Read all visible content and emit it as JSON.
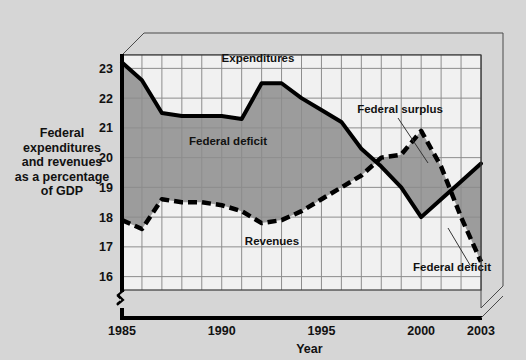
{
  "figure": {
    "background_color": "#d6d6d6",
    "plot_background_color": "#f1f1f1",
    "fill_color": "#9c9c9c",
    "line_color": "#000000",
    "grid_color": "#8d8d8d",
    "frame_color": "#000000"
  },
  "side_label": {
    "lines": [
      "Federal",
      "expenditures",
      "and revenues",
      "as a percentage",
      "of GDP"
    ]
  },
  "axes": {
    "x_title": "Year",
    "y_ticks": [
      "16",
      "17",
      "18",
      "19",
      "20",
      "21",
      "22",
      "23"
    ],
    "x_ticks": [
      "1985",
      "1990",
      "1995",
      "2000",
      "2003"
    ],
    "axis_break_symbol": "break-mark"
  },
  "annotations": [
    {
      "id": "expenditures",
      "text": "Expenditures"
    },
    {
      "id": "federal-deficit-left",
      "text": "Federal deficit"
    },
    {
      "id": "revenues",
      "text": "Revenues"
    },
    {
      "id": "federal-surplus",
      "text": "Federal surplus"
    },
    {
      "id": "federal-deficit-right",
      "text": "Federal deficit"
    }
  ],
  "chart_data": {
    "type": "line",
    "title": "",
    "subtitle": "",
    "xlabel": "Year",
    "ylabel": "Federal expenditures and revenues as a percentage of GDP",
    "xlim": [
      1985,
      2003
    ],
    "ylim": [
      15.5,
      23.6
    ],
    "ytick_values": [
      16,
      17,
      18,
      19,
      20,
      21,
      22,
      23
    ],
    "xtick_values": [
      1985,
      1990,
      1995,
      2000,
      2003
    ],
    "y_axis_broken_below": 16,
    "grid": true,
    "legend": "inline-annotations",
    "x": [
      1985,
      1986,
      1987,
      1988,
      1989,
      1990,
      1991,
      1992,
      1993,
      1994,
      1995,
      1996,
      1997,
      1998,
      1999,
      2000,
      2001,
      2002,
      2003
    ],
    "series": [
      {
        "name": "Expenditures",
        "style": "solid",
        "values": [
          23.2,
          22.6,
          21.5,
          21.4,
          21.4,
          21.4,
          21.3,
          22.5,
          22.5,
          22.0,
          21.6,
          21.2,
          20.3,
          19.7,
          19.0,
          18.0,
          18.6,
          19.2,
          19.8
        ]
      },
      {
        "name": "Revenues",
        "style": "dashed",
        "values": [
          17.9,
          17.6,
          18.6,
          18.5,
          18.5,
          18.4,
          18.2,
          17.8,
          17.9,
          18.2,
          18.6,
          19.0,
          19.4,
          20.0,
          20.1,
          20.9,
          19.7,
          18.0,
          16.5
        ]
      }
    ],
    "shaded_regions": [
      {
        "name": "Federal deficit",
        "from_year": 1985,
        "to_year": 1997,
        "meaning": "expenditures above revenues"
      },
      {
        "name": "Federal surplus",
        "from_year": 1998,
        "to_year": 2001,
        "meaning": "revenues above expenditures"
      },
      {
        "name": "Federal deficit",
        "from_year": 2001,
        "to_year": 2003,
        "meaning": "expenditures above revenues"
      }
    ]
  }
}
